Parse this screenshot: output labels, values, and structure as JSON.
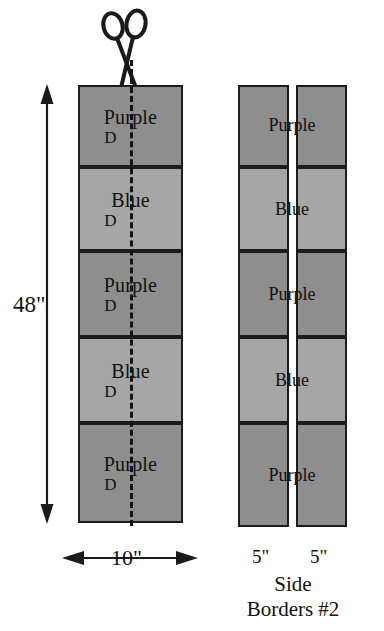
{
  "figure": {
    "caption_lines": [
      "Side",
      "Borders #2"
    ],
    "tool_icon": "scissors-icon",
    "cut_line_style": "dashed"
  },
  "left_strip": {
    "name": "uncut-strip",
    "height_label": "48\"",
    "width_label": "10\"",
    "blocks": [
      {
        "label": "Purple",
        "sub": "D",
        "color_key": "purple"
      },
      {
        "label": "Blue",
        "sub": "D",
        "color_key": "blue"
      },
      {
        "label": "Purple",
        "sub": "D",
        "color_key": "purple"
      },
      {
        "label": "Blue",
        "sub": "D",
        "color_key": "blue"
      },
      {
        "label": "Purple",
        "sub": "D",
        "color_key": "purple"
      }
    ]
  },
  "right_pair": {
    "name": "cut-strips",
    "width_label_left": "5\"",
    "width_label_right": "5\"",
    "blocks": [
      {
        "label": "Purple",
        "color_key": "purple"
      },
      {
        "label": "Blue",
        "color_key": "blue"
      },
      {
        "label": "Purple",
        "color_key": "purple"
      },
      {
        "label": "Blue",
        "color_key": "blue"
      },
      {
        "label": "Purple",
        "color_key": "purple"
      }
    ]
  },
  "colors": {
    "purple": "#8e8e8e",
    "blue": "#a6a6a6",
    "outline": "#1c1c1c",
    "ink": "#111111",
    "background": "#ffffff"
  }
}
